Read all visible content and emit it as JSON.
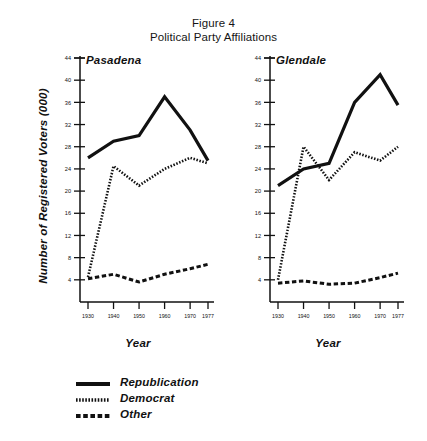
{
  "figure": {
    "title_line1": "Figure 4",
    "title_line2": "Political Party Affiliations",
    "ylabel": "Number of Registered Voters (000)",
    "xlabel": "Year"
  },
  "legend": {
    "items": [
      {
        "label": "Republication",
        "style": "solid"
      },
      {
        "label": "Democrat",
        "style": "dotted"
      },
      {
        "label": "Other",
        "style": "dashed"
      }
    ]
  },
  "panels": [
    {
      "id": "pasadena",
      "title": "Pasadena",
      "xlabel": "Year"
    },
    {
      "id": "glendale",
      "title": "Glendale",
      "xlabel": "Year"
    }
  ],
  "chart_data": [
    {
      "type": "line",
      "title": "Pasadena",
      "subtitle": "Figure 4 — Political Party Affiliations",
      "xlabel": "Year",
      "ylabel": "Number of Registered Voters (000)",
      "x": [
        1930,
        1940,
        1950,
        1960,
        1970,
        1977
      ],
      "xticklabels": [
        "1930",
        "1940",
        "1950",
        "1960",
        "1970",
        "1977"
      ],
      "yticks": [
        4,
        8,
        12,
        16,
        20,
        24,
        28,
        32,
        36,
        40,
        44
      ],
      "ylim": [
        0,
        44
      ],
      "grid": false,
      "legend_position": "below-figure",
      "series": [
        {
          "name": "Republication",
          "style": "solid",
          "values": [
            26.0,
            29.0,
            30.0,
            37.0,
            31.0,
            25.5
          ]
        },
        {
          "name": "Democrat",
          "style": "dotted",
          "values": [
            4.5,
            24.5,
            21.0,
            24.0,
            26.0,
            25.0
          ]
        },
        {
          "name": "Other",
          "style": "dashed",
          "values": [
            4.2,
            5.0,
            3.6,
            5.0,
            6.0,
            6.8
          ]
        }
      ]
    },
    {
      "type": "line",
      "title": "Glendale",
      "subtitle": "Figure 4 — Political Party Affiliations",
      "xlabel": "Year",
      "ylabel": "Number of Registered Voters (000)",
      "x": [
        1930,
        1940,
        1950,
        1960,
        1970,
        1977
      ],
      "xticklabels": [
        "1930",
        "1940",
        "1950",
        "1960",
        "1970",
        "1977"
      ],
      "yticks": [
        4,
        8,
        12,
        16,
        20,
        24,
        28,
        32,
        36,
        40,
        44
      ],
      "ylim": [
        0,
        44
      ],
      "grid": false,
      "legend_position": "below-figure",
      "series": [
        {
          "name": "Republication",
          "style": "solid",
          "values": [
            21.0,
            24.0,
            25.0,
            36.0,
            41.0,
            35.5
          ]
        },
        {
          "name": "Democrat",
          "style": "dotted",
          "values": [
            4.0,
            28.0,
            22.0,
            27.0,
            25.5,
            28.0
          ]
        },
        {
          "name": "Other",
          "style": "dashed",
          "values": [
            3.4,
            3.8,
            3.2,
            3.4,
            4.4,
            5.2
          ]
        }
      ]
    }
  ]
}
